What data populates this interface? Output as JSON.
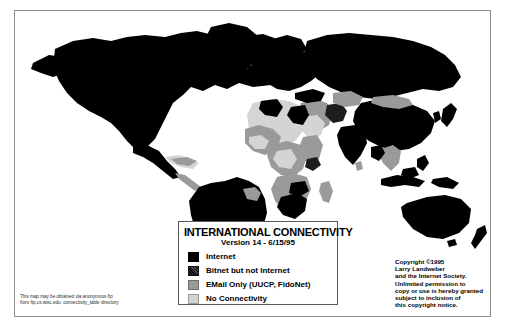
{
  "map": {
    "title_alt": "International Connectivity World Map"
  },
  "legend": {
    "title": "INTERNATIONAL CONNECTIVITY",
    "version": "Version 14 - 6/15/95",
    "items": [
      {
        "label": "Internet",
        "color": "#000000",
        "swatch": "sw-internet"
      },
      {
        "label": "Bitnet but not Internet",
        "color": "#1d1d1d",
        "swatch": "sw-bitnet"
      },
      {
        "label": "EMail Only (UUCP, FidoNet)",
        "color": "#9a9a9a",
        "swatch": "sw-email"
      },
      {
        "label": "No Connectivity",
        "color": "#d4d4d4",
        "swatch": "sw-none"
      }
    ]
  },
  "copyright": {
    "lines": [
      "Copyright ©1995",
      "Larry Landweber",
      "and the Internet Society.",
      "Unlimited permission to",
      "copy or use is hereby granted",
      "subject to inclusion of",
      "this copyright notice."
    ]
  },
  "ftp_note": {
    "lines": [
      "This map may be obtained via anonymous ftp",
      "from ftp.cs.wisc.edu, connectivity_table directory"
    ]
  },
  "colors": {
    "internet": "#000000",
    "bitnet": "#1d1d1d",
    "email_only": "#9a9a9a",
    "no_connectivity": "#d4d4d4",
    "frame": "#8d8d8d",
    "background": "#ffffff"
  }
}
